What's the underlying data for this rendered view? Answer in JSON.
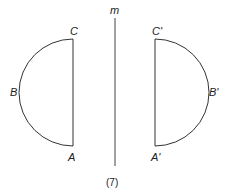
{
  "diagram": {
    "mirror_line_label": "m",
    "caption": "(7)",
    "original": {
      "top": "C",
      "middle": "B",
      "bottom": "A"
    },
    "image": {
      "top": "C'",
      "middle": "B'",
      "bottom": "A'"
    },
    "stroke_color": "#333333"
  }
}
